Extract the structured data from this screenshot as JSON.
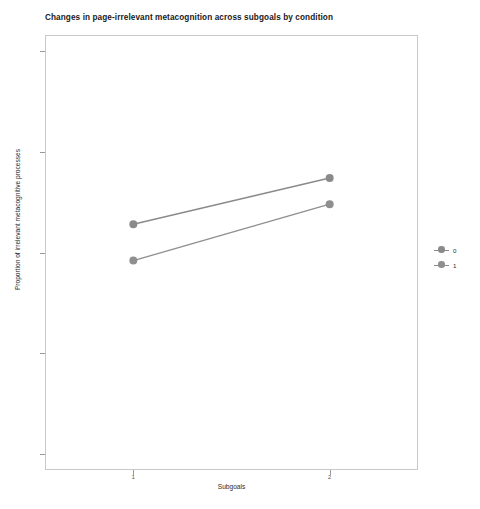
{
  "chart_data": {
    "type": "line",
    "title": "Changes in page-irrelevant metacognition across subgoals by condition",
    "xlabel": "Subgoals",
    "ylabel": "Proportion of irrelevant metacognitive processes",
    "x": [
      1,
      2
    ],
    "xtick_labels": [
      "1",
      "2"
    ],
    "ytick_labels": [
      "0.00",
      "0.25",
      "0.50",
      "0.75",
      "1.00"
    ],
    "ytick_values": [
      0.0,
      0.25,
      0.5,
      0.75,
      1.0
    ],
    "xlim": [
      0.55,
      2.45
    ],
    "ylim": [
      -0.04,
      1.04
    ],
    "grid": false,
    "legend_position": "right",
    "legend_title": "",
    "series": [
      {
        "name": "0",
        "color": "#8a8a8a",
        "values": [
          0.57,
          0.685
        ]
      },
      {
        "name": "1",
        "color": "#8f8f8f",
        "values": [
          0.48,
          0.62
        ]
      }
    ]
  },
  "legend": {
    "entries": [
      {
        "label": "0"
      },
      {
        "label": "1"
      }
    ]
  },
  "colors": {
    "panel_border": "#c9c9c9",
    "axis_text": "#4d4d4d",
    "title_text": "#1a1a1a",
    "series_0": "#8a8a8a",
    "series_1": "#8f8f8f"
  }
}
